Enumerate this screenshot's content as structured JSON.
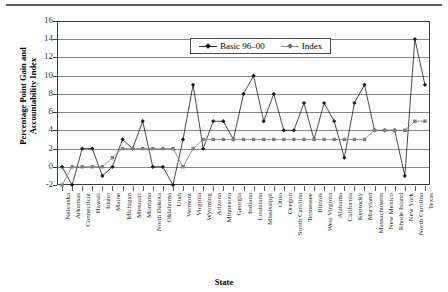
{
  "chart_data": {
    "type": "line",
    "title": "",
    "xlabel": "State",
    "ylabel": "Percentage Point Gain and\nAccountability Index",
    "ylim": [
      -2,
      16
    ],
    "yticks": [
      -2,
      0,
      2,
      4,
      6,
      8,
      10,
      12,
      14,
      16
    ],
    "grid": true,
    "legend_position": "top-center-inside",
    "categories": [
      "Nebraska",
      "Arkansas",
      "Connecticut",
      "Hawaii",
      "Idaho",
      "Maine",
      "Michigan",
      "Missouri",
      "Montana",
      "North Dakota",
      "Oklahoma",
      "Utah",
      "Vermont",
      "Virginia",
      "Wyoming",
      "Arizona",
      "Minnesota",
      "Georgia",
      "Indiana",
      "Louisiana",
      "Mississippi",
      "Ohio",
      "Oregon",
      "South Carolina",
      "Tennessee",
      "Illinois",
      "West Virginia",
      "Alabama",
      "California",
      "Kentucky",
      "Maryland",
      "Massachusetts",
      "New Mexico",
      "Rhode Island",
      "New York",
      "North Carolina",
      "Texas"
    ],
    "series": [
      {
        "name": "Basic 96–00",
        "marker": "filled-diamond",
        "color": "#1a1a1a",
        "values": [
          0,
          -2,
          2,
          2,
          -1,
          0,
          3,
          2,
          5,
          0,
          0,
          -2,
          3,
          9,
          2,
          5,
          5,
          3,
          8,
          10,
          5,
          8,
          4,
          4,
          7,
          3,
          7,
          5,
          1,
          7,
          9,
          4,
          4,
          4,
          -1,
          14,
          9
        ]
      },
      {
        "name": "Index",
        "marker": "filled-square",
        "color": "#7d7d7d",
        "values": [
          -2,
          0,
          0,
          0,
          0,
          1,
          2,
          2,
          2,
          2,
          2,
          2,
          0,
          2,
          3,
          3,
          3,
          3,
          3,
          3,
          3,
          3,
          3,
          3,
          3,
          3,
          3,
          3,
          3,
          3,
          3,
          4,
          4,
          4,
          4,
          5,
          5
        ]
      }
    ]
  },
  "axis": {
    "x_title": "State",
    "y_title_line1": "Percentage Point Gain and",
    "y_title_line2": "Accountability Index"
  },
  "legend": {
    "entries": [
      {
        "label": "Basic 96–00"
      },
      {
        "label": "Index"
      }
    ]
  }
}
